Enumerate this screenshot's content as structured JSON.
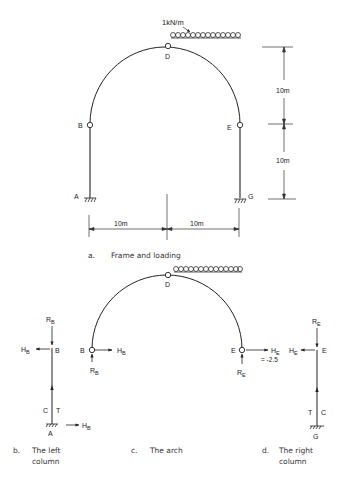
{
  "figure_a": {
    "caption_letter": "a.",
    "caption": "Frame and loading",
    "load_label": "1kN/m",
    "nodes": {
      "A": "A",
      "B": "B",
      "D": "D",
      "E": "E",
      "G": "G"
    },
    "dim_vertical_top": "10m",
    "dim_vertical_bottom": "10m",
    "dim_horizontal_left": "10m",
    "dim_horizontal_right": "10m"
  },
  "figure_b": {
    "caption_letter": "b.",
    "caption_line1": "The left",
    "caption_line2": "column",
    "R": "R",
    "R_sub": "B",
    "H": "H",
    "H_sub": "B",
    "node_top": "B",
    "node_bottom": "A",
    "C": "C",
    "T": "T"
  },
  "figure_c": {
    "caption_letter": "c.",
    "caption": "The arch",
    "node_B": "B",
    "node_D": "D",
    "node_E": "E",
    "HB": "H",
    "HB_sub": "B",
    "RB": "R",
    "RB_sub": "B",
    "HE": "H",
    "HE_sub": "E",
    "HE_value": "= -2.5",
    "RE": "R",
    "RE_sub": "E"
  },
  "figure_d": {
    "caption_letter": "d.",
    "caption_line1": "The right",
    "caption_line2": "column",
    "R": "R",
    "R_sub": "E",
    "H": "H",
    "H_sub": "E",
    "node_top": "E",
    "node_bottom": "G",
    "T": "T",
    "C": "C"
  }
}
